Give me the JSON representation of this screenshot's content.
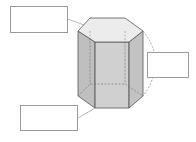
{
  "diagram": {
    "colors": {
      "top_face": "#ececec",
      "side_face_light": "#c8c8c8",
      "side_face_dark": "#b4b4b4",
      "front_face": "#c2c2c2",
      "edge": "#555555",
      "hidden_edge": "#777777",
      "leader_line": "#9a9a9a",
      "box_border": "#9a9a9a"
    },
    "labels": [
      {
        "id": "top-left",
        "text": "",
        "points_to": "top face"
      },
      {
        "id": "right",
        "text": "",
        "points_to": "lateral edge / height"
      },
      {
        "id": "bottom-left",
        "text": "",
        "points_to": "base vertex"
      }
    ]
  }
}
